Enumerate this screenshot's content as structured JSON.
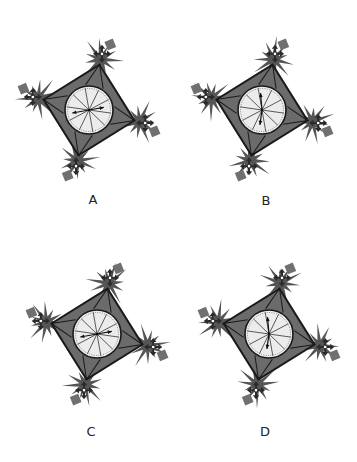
{
  "colors": {
    "frame": "#6b6b6b",
    "frame_stroke": "#1a1a1a",
    "dial": "#ececec",
    "burst": "#555555",
    "block": "#707070",
    "arrow": "#2a2a2a"
  },
  "panels": [
    {
      "label": "A",
      "label_pos": [
        93,
        199
      ],
      "center": [
        89,
        110
      ],
      "rotation": -32,
      "hands": [
        -100,
        80
      ],
      "hand_style": "left-right"
    },
    {
      "label": "B",
      "label_pos": [
        266,
        200
      ],
      "center": [
        262,
        110
      ],
      "rotation": -32,
      "hands": [
        -5,
        188
      ],
      "hand_style": "up-down"
    },
    {
      "label": "C",
      "label_pos": [
        91,
        431
      ],
      "center": [
        97,
        334
      ],
      "rotation": -32,
      "hands": [
        -100,
        80
      ],
      "hand_style": "left-right"
    },
    {
      "label": "D",
      "label_pos": [
        265,
        431
      ],
      "center": [
        269,
        334
      ],
      "rotation": -32,
      "hands": [
        -5,
        188
      ],
      "hand_style": "up-down"
    }
  ]
}
